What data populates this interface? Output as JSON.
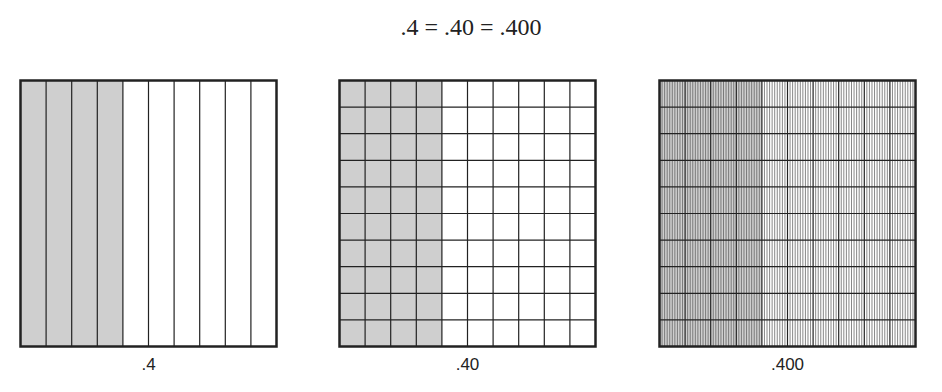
{
  "title": ".4 = .40 = .400",
  "colors": {
    "shade": "#cfcfcf",
    "line": "#222222",
    "fine_line": "#555555",
    "background": "#ffffff"
  },
  "panels": [
    {
      "label": ".4",
      "columns": 10,
      "rows": 1,
      "shaded_columns": 4,
      "sub_columns": 1,
      "sub_rows": 1,
      "description": "4 of 10 columns shaded (tenths)"
    },
    {
      "label": ".40",
      "columns": 10,
      "rows": 10,
      "shaded_columns": 4,
      "sub_columns": 1,
      "sub_rows": 1,
      "description": "40 of 100 squares shaded (hundredths)"
    },
    {
      "label": ".400",
      "columns": 10,
      "rows": 10,
      "shaded_columns": 4,
      "sub_columns": 10,
      "sub_rows": 1,
      "description": "400 of 1000 cells shaded (thousandths)"
    }
  ]
}
